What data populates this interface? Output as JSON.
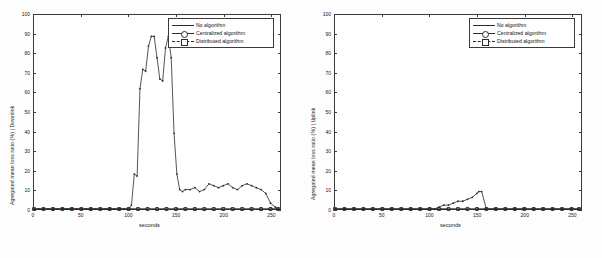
{
  "figure": {
    "background": "#fdfdfd",
    "axis_color": "#3a3a3a",
    "line_color": "#2b2b2b"
  },
  "panels": [
    {
      "id": "downlink",
      "ylabel": "Agregated mean loss ratio (%) | Downlink",
      "xlabel": "seconds",
      "yticks": [
        "0",
        "10",
        "20",
        "30",
        "40",
        "50",
        "60",
        "70",
        "80",
        "90",
        "100"
      ],
      "xticks": [
        "0",
        "50",
        "100",
        "150",
        "200",
        "250"
      ],
      "legend": [
        {
          "label": "No algorithm",
          "marker": "none",
          "style": "solid"
        },
        {
          "label": "Centralized algorithm",
          "marker": "circ",
          "style": "solid"
        },
        {
          "label": "Distributed algorithm",
          "marker": "sq",
          "style": "dash"
        }
      ]
    },
    {
      "id": "uplink",
      "ylabel": "Agregated mean loss ratio (%) | Uplink",
      "xlabel": "seconds",
      "yticks": [
        "0",
        "10",
        "20",
        "30",
        "40",
        "50",
        "60",
        "70",
        "80",
        "90",
        "100"
      ],
      "xticks": [
        "0",
        "50",
        "100",
        "150",
        "200",
        "250"
      ],
      "legend": [
        {
          "label": "No algorithm",
          "marker": "none",
          "style": "solid"
        },
        {
          "label": "Centralized algorithm",
          "marker": "circ",
          "style": "solid"
        },
        {
          "label": "Distributed algorithm",
          "marker": "sq",
          "style": "dash"
        }
      ]
    }
  ],
  "chart_data": [
    {
      "type": "line",
      "title": "",
      "panel": "downlink",
      "xlabel": "seconds",
      "ylabel": "Agregated mean loss ratio (%) | Downlink",
      "xlim": [
        0,
        260
      ],
      "ylim": [
        0,
        100
      ],
      "xticks": [
        0,
        50,
        100,
        150,
        200,
        250
      ],
      "yticks": [
        0,
        10,
        20,
        30,
        40,
        50,
        60,
        70,
        80,
        90,
        100
      ],
      "grid": false,
      "legend_position": "top-right",
      "series": [
        {
          "name": "No algorithm",
          "marker": "none",
          "x": [
            0,
            5,
            10,
            15,
            20,
            25,
            30,
            35,
            40,
            45,
            50,
            55,
            60,
            65,
            70,
            75,
            80,
            85,
            90,
            95,
            100,
            103,
            106,
            109,
            112,
            115,
            118,
            121,
            124,
            127,
            130,
            133,
            136,
            139,
            142,
            145,
            148,
            151,
            154,
            157,
            160,
            165,
            170,
            175,
            180,
            185,
            190,
            195,
            200,
            205,
            210,
            215,
            220,
            225,
            230,
            235,
            240,
            245,
            250,
            255,
            258
          ],
          "y": [
            0,
            0,
            0,
            0,
            0,
            0,
            0,
            0,
            0,
            0,
            0,
            0,
            0,
            0,
            0,
            0,
            0,
            0,
            0,
            0,
            0,
            2,
            18,
            17,
            62,
            72,
            71,
            84,
            89,
            89,
            78,
            67,
            66,
            83,
            89,
            78,
            39,
            18,
            10,
            9,
            10,
            10,
            11,
            9,
            10,
            13,
            12,
            11,
            12,
            13,
            11,
            10,
            12,
            13,
            12,
            11,
            10,
            8,
            3,
            1,
            0
          ]
        },
        {
          "name": "Centralized algorithm",
          "marker": "circ",
          "x": [
            0,
            10,
            20,
            30,
            40,
            50,
            60,
            70,
            80,
            90,
            100,
            110,
            120,
            130,
            140,
            150,
            160,
            170,
            180,
            190,
            200,
            210,
            220,
            230,
            240,
            250,
            258
          ],
          "y": [
            0,
            0,
            0,
            0,
            0,
            0,
            0,
            0,
            0,
            0,
            0,
            0,
            0,
            0,
            0,
            0,
            0,
            0,
            0,
            0,
            0,
            0,
            0,
            0,
            0,
            0,
            0
          ]
        },
        {
          "name": "Distributed algorithm",
          "marker": "sq",
          "x": [
            0,
            10,
            20,
            30,
            40,
            50,
            60,
            70,
            80,
            90,
            100,
            110,
            120,
            130,
            140,
            150,
            160,
            170,
            180,
            190,
            200,
            210,
            220,
            230,
            240,
            250,
            258
          ],
          "y": [
            0,
            0,
            0,
            0,
            0,
            0,
            0,
            0,
            0,
            0,
            0,
            0,
            0,
            0,
            0,
            0,
            0,
            0,
            0,
            0,
            0,
            0,
            0,
            0,
            0,
            0,
            0
          ]
        }
      ]
    },
    {
      "type": "line",
      "title": "",
      "panel": "uplink",
      "xlabel": "seconds",
      "ylabel": "Agregated mean loss ratio (%) | Uplink",
      "xlim": [
        0,
        260
      ],
      "ylim": [
        0,
        100
      ],
      "xticks": [
        0,
        50,
        100,
        150,
        200,
        250
      ],
      "yticks": [
        0,
        10,
        20,
        30,
        40,
        50,
        60,
        70,
        80,
        90,
        100
      ],
      "grid": false,
      "legend_position": "top-right",
      "series": [
        {
          "name": "No algorithm",
          "marker": "none",
          "x": [
            0,
            10,
            20,
            30,
            40,
            50,
            60,
            70,
            80,
            90,
            100,
            105,
            110,
            115,
            120,
            125,
            130,
            135,
            140,
            145,
            150,
            152,
            155,
            160,
            170,
            180,
            190,
            200,
            210,
            220,
            230,
            240,
            250,
            258
          ],
          "y": [
            0,
            0,
            0,
            0,
            0,
            0,
            0,
            0,
            0,
            0,
            0,
            0,
            1,
            2,
            2,
            3,
            4,
            4,
            5,
            6,
            8,
            9,
            9,
            0,
            0,
            0,
            0,
            0,
            0,
            0,
            0,
            0,
            0,
            0
          ]
        },
        {
          "name": "Centralized algorithm",
          "marker": "circ",
          "x": [
            0,
            10,
            20,
            30,
            40,
            50,
            60,
            70,
            80,
            90,
            100,
            110,
            120,
            130,
            140,
            150,
            160,
            170,
            180,
            190,
            200,
            210,
            220,
            230,
            240,
            250,
            258
          ],
          "y": [
            0,
            0,
            0,
            0,
            0,
            0,
            0,
            0,
            0,
            0,
            0,
            0,
            0,
            0,
            0,
            0,
            0,
            0,
            0,
            0,
            0,
            0,
            0,
            0,
            0,
            0,
            0
          ]
        },
        {
          "name": "Distributed algorithm",
          "marker": "sq",
          "x": [
            0,
            10,
            20,
            30,
            40,
            50,
            60,
            70,
            80,
            90,
            100,
            110,
            120,
            130,
            140,
            150,
            160,
            170,
            180,
            190,
            200,
            210,
            220,
            230,
            240,
            250,
            258
          ],
          "y": [
            0,
            0,
            0,
            0,
            0,
            0,
            0,
            0,
            0,
            0,
            0,
            0,
            0,
            0,
            0,
            0,
            0,
            0,
            0,
            0,
            0,
            0,
            0,
            0,
            0,
            0,
            0
          ]
        }
      ]
    }
  ]
}
